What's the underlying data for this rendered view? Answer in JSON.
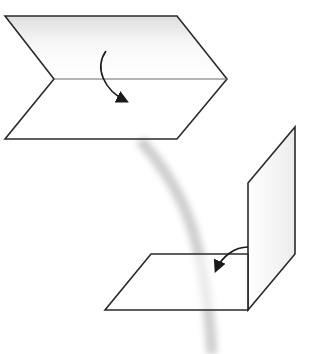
{
  "diagram": {
    "colors": {
      "stroke": "#2a2a2a",
      "fold_line": "#555555",
      "swoosh": "#c8c8c8",
      "shade_top": "#e6e6e6",
      "background": "#ffffff"
    },
    "steps": [
      {
        "name": "flat-sheet-with-fold-line",
        "description": "Sheet with center fold line and downward fold arrow"
      },
      {
        "name": "folded-sheet-right-angle",
        "description": "Sheet folded into an L shape with arrow indicating fold"
      }
    ],
    "transition": "curved gray arc connecting the two steps"
  }
}
